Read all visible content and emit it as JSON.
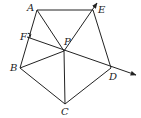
{
  "diagram": {
    "type": "geometry",
    "points": {
      "A": {
        "label": "A",
        "x": 37,
        "y": 10,
        "lx": 27,
        "ly": 11
      },
      "E": {
        "label": "E",
        "x": 93,
        "y": 10,
        "lx": 98,
        "ly": 13
      },
      "F": {
        "label": "F",
        "x": 27,
        "y": 37,
        "lx": 20,
        "ly": 40
      },
      "P": {
        "label": "P",
        "x": 64,
        "y": 51,
        "lx": 64,
        "ly": 45
      },
      "B": {
        "label": "B",
        "x": 20,
        "y": 68,
        "lx": 10,
        "ly": 71
      },
      "D": {
        "label": "D",
        "x": 111,
        "y": 68,
        "lx": 109,
        "ly": 80
      },
      "C": {
        "label": "C",
        "x": 65,
        "y": 104,
        "lx": 61,
        "ly": 115
      }
    },
    "segments": [
      "AE",
      "AB",
      "AP",
      "EP",
      "ED",
      "BP",
      "BC",
      "CP",
      "CD"
    ],
    "rays": [
      {
        "from": "F",
        "through": "P",
        "to": "D",
        "arrow_end": [
          136,
          75
        ]
      },
      {
        "from": "P",
        "through": "E",
        "arrow_end": [
          97,
          3
        ]
      }
    ],
    "right_angle_at": "F",
    "stroke_color": "#222222"
  }
}
